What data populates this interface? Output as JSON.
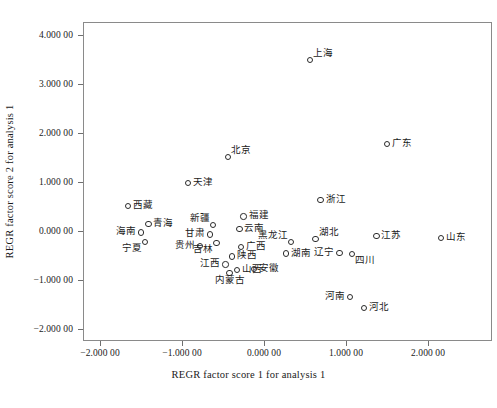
{
  "chart_data": {
    "type": "scatter",
    "title": "",
    "xlabel": "REGR factor score 1 for analysis 1",
    "ylabel": "REGR factor score 2 for analysis 1",
    "xlim": [
      -2.45,
      2.55
    ],
    "ylim": [
      -2.35,
      4.3
    ],
    "grid": false,
    "legend": null,
    "xticks": [
      -2,
      -1,
      0,
      1,
      2
    ],
    "yticks": [
      -2,
      -1,
      0,
      1,
      2,
      3,
      4
    ],
    "xtick_labels": [
      "-2.000 00",
      "-1.000 00",
      "0.000 00",
      "1.000 00",
      "2.000 00"
    ],
    "ytick_labels": [
      "4.000 00",
      "3.000 00",
      "2.000 00",
      "1.000 00",
      "0.000 00",
      "-1.000 00",
      "-2.000 00"
    ],
    "point_labels": [
      "上海",
      "广东",
      "北京",
      "浙江",
      "天津",
      "西藏",
      "青海",
      "海南",
      "宁夏",
      "新疆",
      "福建",
      "云南",
      "甘肃",
      "吉林",
      "贵州",
      "广西",
      "陕西",
      "江西",
      "山西",
      "内蒙古",
      "安徽",
      "黑龙江",
      "湖南",
      "湖北",
      "辽宁",
      "四川",
      "江苏",
      "山东",
      "河南",
      "河北"
    ],
    "points": [
      {
        "label": "上海",
        "x": 0.56,
        "y": 3.49,
        "place": "tr"
      },
      {
        "label": "广东",
        "x": 1.5,
        "y": 1.78,
        "place": "r"
      },
      {
        "label": "北京",
        "x": -0.44,
        "y": 1.51,
        "place": "tr"
      },
      {
        "label": "浙江",
        "x": 0.69,
        "y": 0.63,
        "place": "r"
      },
      {
        "label": "天津",
        "x": -0.93,
        "y": 0.98,
        "place": "r"
      },
      {
        "label": "西藏",
        "x": -1.66,
        "y": 0.51,
        "place": "r"
      },
      {
        "label": "青海",
        "x": -1.41,
        "y": 0.14,
        "place": "r"
      },
      {
        "label": "海南",
        "x": -1.5,
        "y": -0.03,
        "place": "l"
      },
      {
        "label": "宁夏",
        "x": -1.45,
        "y": -0.22,
        "place": "bl"
      },
      {
        "label": "新疆",
        "x": -0.62,
        "y": 0.12,
        "place": "tl"
      },
      {
        "label": "福建",
        "x": -0.25,
        "y": 0.3,
        "place": "r"
      },
      {
        "label": "云南",
        "x": -0.3,
        "y": 0.04,
        "place": "r"
      },
      {
        "label": "甘肃",
        "x": -0.66,
        "y": -0.07,
        "place": "l"
      },
      {
        "label": "吉林",
        "x": -0.58,
        "y": -0.25,
        "place": "bl"
      },
      {
        "label": "贵州",
        "x": -0.78,
        "y": -0.3,
        "place": "l"
      },
      {
        "label": "广西",
        "x": -0.28,
        "y": -0.33,
        "place": "r"
      },
      {
        "label": "陕西",
        "x": -0.39,
        "y": -0.52,
        "place": "r"
      },
      {
        "label": "江西",
        "x": -0.47,
        "y": -0.68,
        "place": "l"
      },
      {
        "label": "山西",
        "x": -0.33,
        "y": -0.8,
        "place": "r"
      },
      {
        "label": "内蒙古",
        "x": -0.42,
        "y": -0.86,
        "place": "b"
      },
      {
        "label": "安徽",
        "x": -0.12,
        "y": -0.78,
        "place": "r"
      },
      {
        "label": "黑龙江",
        "x": 0.33,
        "y": -0.22,
        "place": "tl"
      },
      {
        "label": "湖南",
        "x": 0.27,
        "y": -0.46,
        "place": "r"
      },
      {
        "label": "湖北",
        "x": 0.63,
        "y": -0.16,
        "place": "tr"
      },
      {
        "label": "辽宁",
        "x": 0.92,
        "y": -0.45,
        "place": "l"
      },
      {
        "label": "四川",
        "x": 1.07,
        "y": -0.47,
        "place": "br"
      },
      {
        "label": "江苏",
        "x": 1.37,
        "y": -0.1,
        "place": "r"
      },
      {
        "label": "山东",
        "x": 2.16,
        "y": -0.14,
        "place": "r"
      },
      {
        "label": "河南",
        "x": 1.05,
        "y": -1.35,
        "place": "l"
      },
      {
        "label": "河北",
        "x": 1.22,
        "y": -1.57,
        "place": "r"
      }
    ]
  },
  "axes": {
    "x_title": "REGR factor score 1 for analysis 1",
    "y_title": "REGR factor score 2 for analysis 1"
  }
}
